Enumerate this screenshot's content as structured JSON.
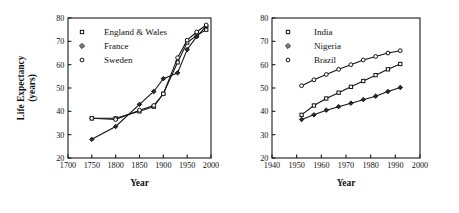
{
  "figure": {
    "panel_count": 2,
    "shared_ylabel": "Life Expectancy",
    "shared_ylabel_sub": "(years)",
    "shared_xlabel": "Year"
  },
  "chart_data": [
    {
      "type": "line",
      "id": "panel-left",
      "title": "",
      "xlabel": "Year",
      "ylabel": "Life Expectancy (years)",
      "xlim": [
        1700,
        2000
      ],
      "ylim": [
        20,
        80
      ],
      "xticks": [
        1700,
        1750,
        1800,
        1850,
        1900,
        1950,
        2000
      ],
      "yticks": [
        20,
        30,
        40,
        50,
        60,
        70,
        80
      ],
      "grid": false,
      "legend_position": "upper-left",
      "series": [
        {
          "name": "England & Wales",
          "marker": "square",
          "x": [
            1750,
            1800,
            1850,
            1880,
            1900,
            1930,
            1950,
            1970,
            1990
          ],
          "values": [
            37,
            37,
            40,
            42,
            47.5,
            61,
            69.5,
            72.5,
            75
          ]
        },
        {
          "name": "France",
          "marker": "diamond",
          "x": [
            1750,
            1800,
            1850,
            1880,
            1900,
            1930,
            1950,
            1970,
            1990
          ],
          "values": [
            28,
            33.5,
            43,
            48.5,
            54,
            56.5,
            66.5,
            72,
            76.5
          ]
        },
        {
          "name": "Sweden",
          "marker": "circle",
          "x": [
            1750,
            1800,
            1850,
            1880,
            1900,
            1930,
            1950,
            1970,
            1990
          ],
          "values": [
            37,
            36.5,
            40.5,
            42.5,
            47.5,
            63,
            70.5,
            74,
            77
          ]
        }
      ]
    },
    {
      "type": "line",
      "id": "panel-right",
      "title": "",
      "xlabel": "Year",
      "ylabel": "Life Expectancy (years)",
      "xlim": [
        1940,
        2000
      ],
      "ylim": [
        20,
        80
      ],
      "xticks": [
        1940,
        1950,
        1960,
        1970,
        1980,
        1990,
        2000
      ],
      "yticks": [
        20,
        30,
        40,
        50,
        60,
        70,
        80
      ],
      "grid": false,
      "legend_position": "upper-left",
      "series": [
        {
          "name": "India",
          "marker": "square",
          "x": [
            1952,
            1957,
            1962,
            1967,
            1972,
            1977,
            1982,
            1987,
            1992
          ],
          "values": [
            38.5,
            42.5,
            45.5,
            48,
            50.5,
            53,
            55.5,
            58,
            60.3
          ]
        },
        {
          "name": "Nigeria",
          "marker": "diamond",
          "x": [
            1952,
            1957,
            1962,
            1967,
            1972,
            1977,
            1982,
            1987,
            1992
          ],
          "values": [
            36.5,
            38.5,
            40.5,
            42,
            43.5,
            45,
            46.5,
            48.5,
            50.2
          ]
        },
        {
          "name": "Brazil",
          "marker": "circle",
          "x": [
            1952,
            1957,
            1962,
            1967,
            1972,
            1977,
            1982,
            1987,
            1992
          ],
          "values": [
            51,
            53.5,
            55.8,
            58,
            60,
            62,
            63.5,
            65,
            66
          ]
        }
      ]
    }
  ],
  "panel_left": {
    "ylabel_line1": "Life Expectancy",
    "ylabel_line2": "(years)",
    "xlabel": "Year",
    "xticklabels": [
      "1700",
      "1750",
      "1800",
      "1850",
      "1900",
      "1950",
      "2000"
    ],
    "yticklabels": [
      "20",
      "30",
      "40",
      "50",
      "60",
      "70",
      "80"
    ],
    "legend": [
      {
        "label": "England & Wales",
        "marker": "square"
      },
      {
        "label": "France",
        "marker": "diamond"
      },
      {
        "label": "Sweden",
        "marker": "circle"
      }
    ]
  },
  "panel_right": {
    "xlabel": "Year",
    "xticklabels": [
      "1940",
      "1950",
      "1960",
      "1970",
      "1980",
      "1990",
      "2000"
    ],
    "yticklabels": [
      "20",
      "30",
      "40",
      "50",
      "60",
      "70",
      "80"
    ],
    "legend": [
      {
        "label": "India",
        "marker": "square"
      },
      {
        "label": "Nigeria",
        "marker": "diamond"
      },
      {
        "label": "Brazil",
        "marker": "circle"
      }
    ]
  },
  "colors": {
    "ink": "#111111",
    "background": "#ffffff",
    "marker_fill": "#ffffff",
    "diamond_fill": "#2b2b2b"
  }
}
